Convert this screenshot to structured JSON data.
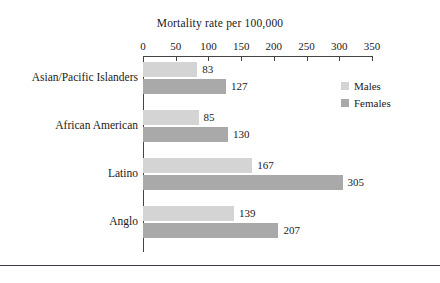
{
  "chart_data": {
    "type": "bar",
    "orientation": "horizontal",
    "title": "Mortality rate per 100,000",
    "xlabel": "",
    "ylabel": "",
    "xlim": [
      0,
      350
    ],
    "xticks": [
      0,
      50,
      100,
      150,
      200,
      250,
      300,
      350
    ],
    "grid": false,
    "legend_position": "upper-right",
    "categories": [
      "Asian/Pacific Islanders",
      "African American",
      "Latino",
      "Anglo"
    ],
    "series": [
      {
        "name": "Males",
        "color": "#d4d4d4",
        "values": [
          83,
          85,
          167,
          139
        ]
      },
      {
        "name": "Females",
        "color": "#a9a9a9",
        "values": [
          127,
          130,
          305,
          207
        ]
      }
    ]
  }
}
